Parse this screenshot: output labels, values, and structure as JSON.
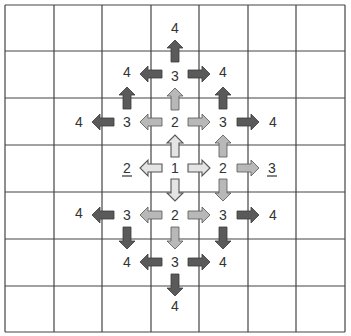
{
  "grid": {
    "columns": 7,
    "rows": 7,
    "x_lines": [
      5,
      54,
      102,
      151,
      199,
      248,
      296,
      345
    ],
    "y_lines": [
      5,
      51,
      98,
      145,
      192,
      239,
      286,
      332
    ],
    "line_color": "#444444"
  },
  "colors": {
    "level1_fill": "#e4e4e4",
    "level2_fill": "#b8b8b8",
    "level3_fill": "#5a5a5a",
    "arrow_stroke": "#555555"
  },
  "labels": [
    {
      "text": "1",
      "x": 175,
      "y": 168,
      "underline": false
    },
    {
      "text": "2",
      "x": 175,
      "y": 122,
      "underline": false
    },
    {
      "text": "2",
      "x": 223,
      "y": 168,
      "underline": false
    },
    {
      "text": "2",
      "x": 175,
      "y": 215,
      "underline": false
    },
    {
      "text": "2",
      "x": 127,
      "y": 168,
      "underline": true
    },
    {
      "text": "3",
      "x": 175,
      "y": 76,
      "underline": false
    },
    {
      "text": "3",
      "x": 127,
      "y": 122,
      "underline": false
    },
    {
      "text": "3",
      "x": 223,
      "y": 122,
      "underline": false
    },
    {
      "text": "3",
      "x": 272,
      "y": 168,
      "underline": true
    },
    {
      "text": "3",
      "x": 127,
      "y": 215,
      "underline": false
    },
    {
      "text": "3",
      "x": 223,
      "y": 215,
      "underline": false
    },
    {
      "text": "3",
      "x": 175,
      "y": 262,
      "underline": false
    },
    {
      "text": "4",
      "x": 175,
      "y": 28,
      "underline": false
    },
    {
      "text": "4",
      "x": 127,
      "y": 72,
      "underline": false
    },
    {
      "text": "4",
      "x": 223,
      "y": 72,
      "underline": false
    },
    {
      "text": "4",
      "x": 79,
      "y": 122,
      "underline": false
    },
    {
      "text": "4",
      "x": 273,
      "y": 122,
      "underline": false
    },
    {
      "text": "4",
      "x": 79,
      "y": 213,
      "underline": false
    },
    {
      "text": "4",
      "x": 273,
      "y": 215,
      "underline": false
    },
    {
      "text": "4",
      "x": 127,
      "y": 262,
      "underline": false
    },
    {
      "text": "4",
      "x": 223,
      "y": 262,
      "underline": false
    },
    {
      "text": "4",
      "x": 175,
      "y": 306,
      "underline": false
    }
  ],
  "arrows": [
    {
      "level": 1,
      "dir": "up",
      "x": 175,
      "y": 146
    },
    {
      "level": 1,
      "dir": "down",
      "x": 175,
      "y": 190
    },
    {
      "level": 1,
      "dir": "left",
      "x": 151,
      "y": 168
    },
    {
      "level": 1,
      "dir": "right",
      "x": 199,
      "y": 168
    },
    {
      "level": 2,
      "dir": "up",
      "x": 175,
      "y": 99
    },
    {
      "level": 2,
      "dir": "left",
      "x": 151,
      "y": 122
    },
    {
      "level": 2,
      "dir": "right",
      "x": 199,
      "y": 122
    },
    {
      "level": 2,
      "dir": "up",
      "x": 223,
      "y": 146
    },
    {
      "level": 2,
      "dir": "right",
      "x": 248,
      "y": 168
    },
    {
      "level": 2,
      "dir": "down",
      "x": 223,
      "y": 190
    },
    {
      "level": 2,
      "dir": "down",
      "x": 175,
      "y": 238
    },
    {
      "level": 2,
      "dir": "left",
      "x": 151,
      "y": 215
    },
    {
      "level": 2,
      "dir": "right",
      "x": 199,
      "y": 215
    },
    {
      "level": 2,
      "dir": "left",
      "x": 151,
      "y": 168,
      "skip": true
    },
    {
      "level": 3,
      "dir": "up",
      "x": 175,
      "y": 51
    },
    {
      "level": 3,
      "dir": "left",
      "x": 151,
      "y": 74
    },
    {
      "level": 3,
      "dir": "right",
      "x": 199,
      "y": 74
    },
    {
      "level": 3,
      "dir": "up",
      "x": 127,
      "y": 98
    },
    {
      "level": 3,
      "dir": "up",
      "x": 223,
      "y": 98
    },
    {
      "level": 3,
      "dir": "left",
      "x": 103,
      "y": 122
    },
    {
      "level": 3,
      "dir": "right",
      "x": 248,
      "y": 122
    },
    {
      "level": 3,
      "dir": "left",
      "x": 103,
      "y": 215
    },
    {
      "level": 3,
      "dir": "right",
      "x": 248,
      "y": 215
    },
    {
      "level": 3,
      "dir": "down",
      "x": 127,
      "y": 238
    },
    {
      "level": 3,
      "dir": "down",
      "x": 223,
      "y": 238
    },
    {
      "level": 3,
      "dir": "left",
      "x": 151,
      "y": 262
    },
    {
      "level": 3,
      "dir": "right",
      "x": 199,
      "y": 262
    },
    {
      "level": 3,
      "dir": "down",
      "x": 175,
      "y": 285
    }
  ]
}
